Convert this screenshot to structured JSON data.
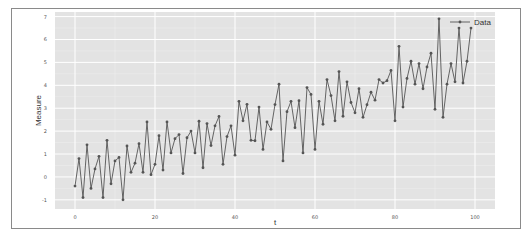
{
  "chart_data": {
    "type": "line",
    "title": "",
    "xlabel": "t",
    "ylabel": "Measure",
    "xlim": [
      -5,
      105
    ],
    "ylim": [
      -1.4,
      7.2
    ],
    "grid": true,
    "legend_position": "upper right",
    "x_ticks": [
      0,
      20,
      40,
      60,
      80,
      100
    ],
    "y_ticks": [
      -1,
      0,
      1,
      2,
      3,
      4,
      5,
      6,
      7
    ],
    "series": [
      {
        "name": "Data",
        "marker": "circle",
        "color": "#555555",
        "x": [
          0,
          1,
          2,
          3,
          4,
          5,
          6,
          7,
          8,
          9,
          10,
          11,
          12,
          13,
          14,
          15,
          16,
          17,
          18,
          19,
          20,
          21,
          22,
          23,
          24,
          25,
          26,
          27,
          28,
          29,
          30,
          31,
          32,
          33,
          34,
          35,
          36,
          37,
          38,
          39,
          40,
          41,
          42,
          43,
          44,
          45,
          46,
          47,
          48,
          49,
          50,
          51,
          52,
          53,
          54,
          55,
          56,
          57,
          58,
          59,
          60,
          61,
          62,
          63,
          64,
          65,
          66,
          67,
          68,
          69,
          70,
          71,
          72,
          73,
          74,
          75,
          76,
          77,
          78,
          79,
          80,
          81,
          82,
          83,
          84,
          85,
          86,
          87,
          88,
          89,
          90,
          91,
          92,
          93,
          94,
          95,
          96,
          97,
          98,
          99
        ],
        "values": [
          -0.4,
          0.8,
          -0.9,
          1.4,
          -0.5,
          0.35,
          0.9,
          -0.9,
          1.6,
          -0.3,
          0.7,
          0.85,
          -1.0,
          1.35,
          0.2,
          0.6,
          1.45,
          0.2,
          2.4,
          0.1,
          0.55,
          1.8,
          0.3,
          2.4,
          1.05,
          1.67,
          1.85,
          0.15,
          1.71,
          2.0,
          1.05,
          2.43,
          0.4,
          2.33,
          1.37,
          2.23,
          2.64,
          0.55,
          1.76,
          2.23,
          0.95,
          3.3,
          2.45,
          3.17,
          1.6,
          1.58,
          3.05,
          1.2,
          2.4,
          2.08,
          3.16,
          4.05,
          0.7,
          2.85,
          3.3,
          2.15,
          3.33,
          1.05,
          3.9,
          3.6,
          1.2,
          3.3,
          2.3,
          4.25,
          3.55,
          2.45,
          4.6,
          2.65,
          4.15,
          3.25,
          2.8,
          3.85,
          2.6,
          3.15,
          3.7,
          3.35,
          4.25,
          4.1,
          4.2,
          4.65,
          2.45,
          5.7,
          3.05,
          4.3,
          5.05,
          4.05,
          4.95,
          3.85,
          4.8,
          5.4,
          2.95,
          6.9,
          2.6,
          4.05,
          4.95,
          4.15,
          6.5,
          4.1,
          5.05,
          6.5
        ]
      }
    ]
  },
  "colors": {
    "plot_background": "#e3e3e3",
    "grid": "#ffffff",
    "line": "#555555"
  }
}
